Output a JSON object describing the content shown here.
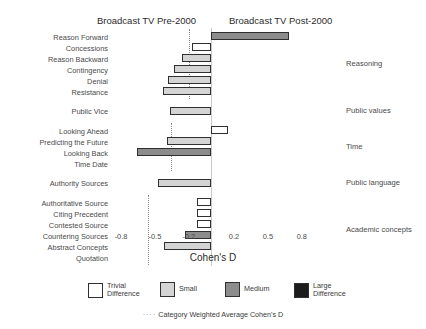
{
  "header": {
    "left_title": "Broadcast TV Pre-2000",
    "right_title": "Broadcast TV Post-2000"
  },
  "axis": {
    "x_title": "Cohen's D",
    "ticks": [
      "-0.8",
      "-0.5",
      "-0.2",
      "0.2",
      "0.5",
      "0.8"
    ],
    "tick_values": [
      -0.8,
      -0.5,
      -0.2,
      0.2,
      0.5,
      0.8
    ]
  },
  "legend": {
    "items": [
      {
        "label_line1": "Trivial",
        "label_line2": "Difference",
        "key": "trivial",
        "color": "#ffffff"
      },
      {
        "label_line1": "Small",
        "label_line2": "",
        "key": "small",
        "color": "#d4d4d4"
      },
      {
        "label_line1": "Medium",
        "label_line2": "",
        "key": "medium",
        "color": "#8c8c8c"
      },
      {
        "label_line1": "Large",
        "label_line2": "Difference",
        "key": "large",
        "color": "#1c1c1c"
      }
    ],
    "note_dash": "····",
    "note": "Category Weighted Average Cohen's D"
  },
  "categories": [
    {
      "name": "Reasoning",
      "avg": -0.2
    },
    {
      "name": "Public values",
      "avg": null
    },
    {
      "name": "Time",
      "avg": -0.36
    },
    {
      "name": "Public language",
      "avg": null
    },
    {
      "name": "Academic concepts",
      "avg": -0.56
    }
  ],
  "chart_data": {
    "type": "bar",
    "title": "",
    "xlabel": "Cohen's D",
    "ylabel": "",
    "xlim": [
      -0.95,
      0.95
    ],
    "grid": false,
    "orientation": "horizontal",
    "legend_position": "bottom",
    "categories": [
      "Reason Forward",
      "Concessions",
      "Reason Backward",
      "Contingency",
      "Denial",
      "Resistance",
      "Public Vice",
      "Looking Ahead",
      "Predicting the Future",
      "Looking Back",
      "Time Date",
      "Authority Sources",
      "Authoritative Source",
      "Citing Precedent",
      "Contested Source",
      "Countering Sources",
      "Abstract Concepts",
      "Quotation"
    ],
    "values": [
      0.69,
      -0.17,
      -0.26,
      -0.33,
      -0.38,
      -0.43,
      -0.37,
      0.15,
      -0.39,
      -0.66,
      0.0,
      -0.47,
      -0.13,
      -0.13,
      -0.13,
      -0.23,
      -0.42,
      0.0
    ],
    "effect_sizes": [
      "medium",
      "trivial",
      "small",
      "small",
      "small",
      "small",
      "small",
      "trivial",
      "small",
      "medium",
      "none",
      "small",
      "trivial",
      "trivial",
      "trivial",
      "medium",
      "small",
      "none"
    ],
    "group_of_bar": [
      "Reasoning",
      "Reasoning",
      "Reasoning",
      "Reasoning",
      "Reasoning",
      "Reasoning",
      "Public values",
      "Time",
      "Time",
      "Time",
      "Time",
      "Public language",
      "Academic concepts",
      "Academic concepts",
      "Academic concepts",
      "Academic concepts",
      "Academic concepts",
      "Academic concepts"
    ],
    "category_weighted_averages": {
      "Reasoning": -0.2,
      "Time": -0.36,
      "Academic concepts": -0.56
    }
  }
}
